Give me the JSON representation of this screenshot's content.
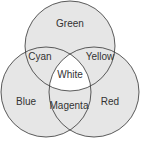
{
  "diagram": {
    "type": "venn-3",
    "colors": {
      "fill": "#e6e6e6",
      "center_fill": "#ffffff",
      "stroke": "#333333",
      "text": "#333333"
    },
    "circles": [
      {
        "name": "Green",
        "cx": 70,
        "cy": 46,
        "r": 45
      },
      {
        "name": "Blue",
        "cx": 46,
        "cy": 92,
        "r": 45
      },
      {
        "name": "Red",
        "cx": 94,
        "cy": 92,
        "r": 45
      }
    ],
    "labels": {
      "green": "Green",
      "blue": "Blue",
      "red": "Red",
      "cyan": "Cyan",
      "yellow": "Yellow",
      "magenta": "Magenta",
      "white": "White"
    }
  }
}
